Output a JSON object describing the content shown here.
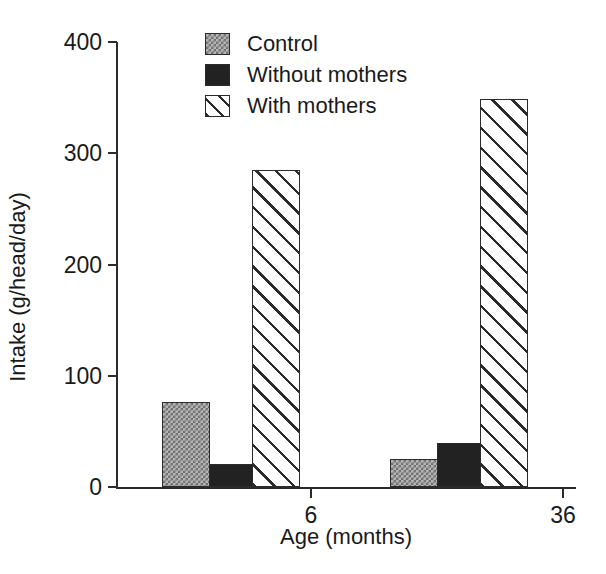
{
  "chart_data": {
    "type": "bar",
    "title": "",
    "subtitle": "",
    "xlabel": "Age (months)",
    "ylabel": "Intake (g/head/day)",
    "categories": [
      "6",
      "36"
    ],
    "series": [
      {
        "name": "Control",
        "values": [
          76,
          25
        ],
        "pattern": "dotted-grey"
      },
      {
        "name": "Without mothers",
        "values": [
          21,
          40
        ],
        "pattern": "solid-black"
      },
      {
        "name": "With mothers",
        "values": [
          285,
          349
        ],
        "pattern": "diagonal-hatch"
      }
    ],
    "ylim": [
      0,
      400
    ],
    "yticks": [
      "0",
      "100",
      "200",
      "300",
      "400"
    ],
    "ytick_values": [
      0,
      100,
      200,
      300,
      400
    ],
    "xtick_labels": [
      "6",
      "36"
    ],
    "grid": false,
    "legend_position": "top-center-left",
    "colors": {
      "axis": "#2b2b2b",
      "text": "#1a1a1a",
      "background": "#ffffff",
      "control_fill": "#b4b4b4",
      "without_mothers_fill": "#222222",
      "with_mothers_fill": "#ffffff"
    }
  },
  "legend": {
    "entries": [
      {
        "label": "Control"
      },
      {
        "label": "Without mothers"
      },
      {
        "label": "With mothers"
      }
    ]
  },
  "axes": {
    "y": {
      "title": "Intake (g/head/day)",
      "ticks": [
        {
          "label": "400",
          "value": 400
        },
        {
          "label": "300",
          "value": 300
        },
        {
          "label": "200",
          "value": 200
        },
        {
          "label": "100",
          "value": 100
        },
        {
          "label": "0",
          "value": 0
        }
      ]
    },
    "x": {
      "title": "Age (months)",
      "ticks": [
        {
          "label": "6"
        },
        {
          "label": "36"
        }
      ]
    }
  }
}
